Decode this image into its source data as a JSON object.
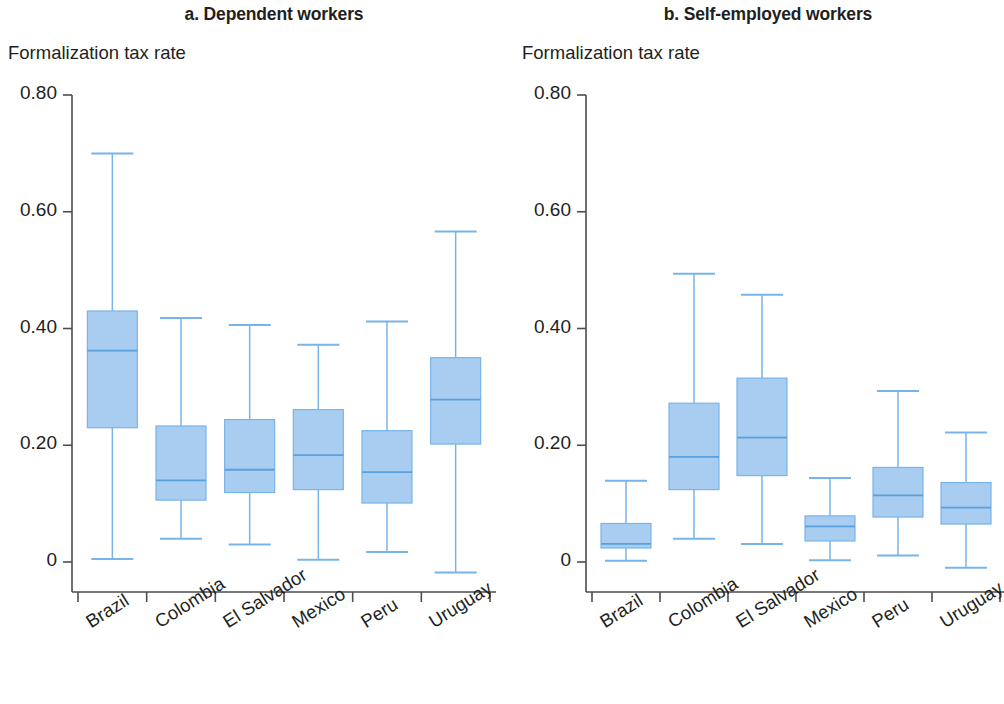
{
  "chart_data": [
    {
      "type": "box",
      "panel_id": "a",
      "title": "a. Dependent workers",
      "ylabel": "Formalization tax rate",
      "xlabel": "",
      "ylim": [
        0,
        0.8
      ],
      "yticks": [
        0,
        0.2,
        0.4,
        0.6,
        0.8
      ],
      "ytick_labels": [
        "0",
        "0.20",
        "0.40",
        "0.60",
        "0.80"
      ],
      "grid": false,
      "legend": "none",
      "categories": [
        "Brazil",
        "Colombia",
        "El Salvador",
        "Mexico",
        "Peru",
        "Uruguay"
      ],
      "boxes": [
        {
          "category": "Brazil",
          "whisker_low": 0.005,
          "q1": 0.23,
          "median": 0.362,
          "q3": 0.43,
          "whisker_high": 0.7
        },
        {
          "category": "Colombia",
          "whisker_low": 0.04,
          "q1": 0.106,
          "median": 0.14,
          "q3": 0.233,
          "whisker_high": 0.418
        },
        {
          "category": "El Salvador",
          "whisker_low": 0.03,
          "q1": 0.119,
          "median": 0.158,
          "q3": 0.244,
          "whisker_high": 0.406
        },
        {
          "category": "Mexico",
          "whisker_low": 0.004,
          "q1": 0.124,
          "median": 0.183,
          "q3": 0.261,
          "whisker_high": 0.372
        },
        {
          "category": "Peru",
          "whisker_low": 0.017,
          "q1": 0.101,
          "median": 0.154,
          "q3": 0.225,
          "whisker_high": 0.412
        },
        {
          "category": "Uruguay",
          "whisker_low": -0.018,
          "q1": 0.202,
          "median": 0.278,
          "q3": 0.35,
          "whisker_high": 0.566
        }
      ]
    },
    {
      "type": "box",
      "panel_id": "b",
      "title": "b. Self-employed workers",
      "ylabel": "Formalization tax rate",
      "xlabel": "",
      "ylim": [
        0,
        0.8
      ],
      "yticks": [
        0,
        0.2,
        0.4,
        0.6,
        0.8
      ],
      "ytick_labels": [
        "0",
        "0.20",
        "0.40",
        "0.60",
        "0.80"
      ],
      "grid": false,
      "legend": "none",
      "categories": [
        "Brazil",
        "Colombia",
        "El Salvador",
        "Mexico",
        "Peru",
        "Uruguay"
      ],
      "boxes": [
        {
          "category": "Brazil",
          "whisker_low": 0.002,
          "q1": 0.024,
          "median": 0.031,
          "q3": 0.066,
          "whisker_high": 0.139
        },
        {
          "category": "Colombia",
          "whisker_low": 0.04,
          "q1": 0.124,
          "median": 0.18,
          "q3": 0.272,
          "whisker_high": 0.494
        },
        {
          "category": "El Salvador",
          "whisker_low": 0.031,
          "q1": 0.148,
          "median": 0.213,
          "q3": 0.315,
          "whisker_high": 0.458
        },
        {
          "category": "Mexico",
          "whisker_low": 0.003,
          "q1": 0.036,
          "median": 0.061,
          "q3": 0.079,
          "whisker_high": 0.144
        },
        {
          "category": "Peru",
          "whisker_low": 0.011,
          "q1": 0.077,
          "median": 0.114,
          "q3": 0.162,
          "whisker_high": 0.293
        },
        {
          "category": "Uruguay",
          "whisker_low": -0.01,
          "q1": 0.065,
          "median": 0.093,
          "q3": 0.136,
          "whisker_high": 0.222
        }
      ]
    }
  ],
  "colors": {
    "box_fill": "#a8cdf0",
    "box_stroke": "#79b4e8",
    "whisker": "#79b4e8",
    "median": "#5aa0de",
    "axis": "#4d4d4d",
    "text": "#231f20"
  }
}
